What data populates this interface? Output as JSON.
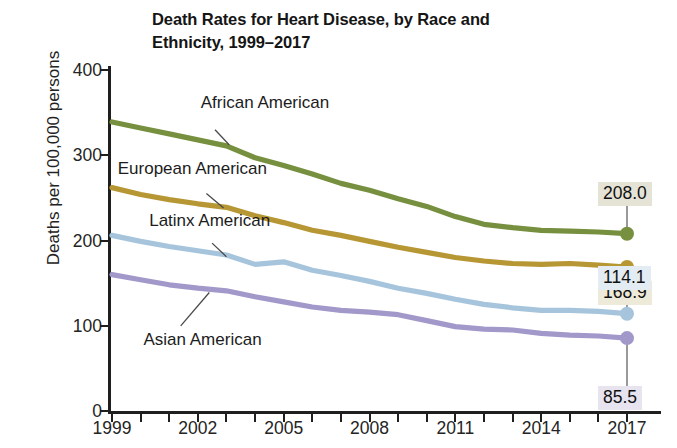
{
  "chart_data": {
    "type": "line",
    "title": "Death Rates for Heart Disease, by Race and Ethnicity, 1999–2017",
    "title_line1": "Death Rates for Heart Disease, by Race and",
    "title_line2": "Ethnicity, 1999–2017",
    "xlabel": "",
    "ylabel": "Deaths per 100,000 persons",
    "xlim": [
      1999,
      2017
    ],
    "ylim": [
      0,
      400
    ],
    "y_ticks": [
      0,
      100,
      200,
      300,
      400
    ],
    "x_ticks": [
      1999,
      2002,
      2005,
      2008,
      2011,
      2014,
      2017
    ],
    "x_tick_labels": [
      "1999",
      "2002",
      "2005",
      "2008",
      "2011",
      "2014",
      "2017"
    ],
    "y_tick_labels": [
      "0",
      "100",
      "200",
      "300",
      "400"
    ],
    "x": [
      1999,
      2000,
      2001,
      2002,
      2003,
      2004,
      2005,
      2006,
      2007,
      2008,
      2009,
      2010,
      2011,
      2012,
      2013,
      2014,
      2015,
      2016,
      2017
    ],
    "grid": false,
    "legend_position": "inline-labels",
    "series": [
      {
        "name": "African American",
        "color": "#77903f",
        "values": [
          339.0,
          332.0,
          325.0,
          318.0,
          311.0,
          297.0,
          288.0,
          278.0,
          267.0,
          259.0,
          249.0,
          240.0,
          228.0,
          219.0,
          215.0,
          212.0,
          211.0,
          210.0,
          208.0
        ],
        "end_value": "208.0",
        "label_x": 2002.1,
        "label_y": 360
      },
      {
        "name": "European American",
        "color": "#b79634",
        "values": [
          262.0,
          254.0,
          248.0,
          243.0,
          239.0,
          229.0,
          221.0,
          212.0,
          206.0,
          199.0,
          192.0,
          186.0,
          180.0,
          176.0,
          173.0,
          172.0,
          173.0,
          171.0,
          168.9
        ],
        "end_value": "168.9",
        "label_x": 1999.2,
        "label_y": 283
      },
      {
        "name": "Latinx American",
        "color": "#a6c5dd",
        "values": [
          206.0,
          199.0,
          193.0,
          188.0,
          183.0,
          172.0,
          175.0,
          165.0,
          159.0,
          152.0,
          144.0,
          138.0,
          131.0,
          125.0,
          121.0,
          118.0,
          118.0,
          117.0,
          114.1
        ],
        "end_value": "114.1",
        "label_x": 2000.3,
        "label_y": 222
      },
      {
        "name": "Asian American",
        "color": "#a298c9",
        "values": [
          160.0,
          154.0,
          148.0,
          144.0,
          141.0,
          134.0,
          128.0,
          122.0,
          118.0,
          116.0,
          113.0,
          106.0,
          99.0,
          96.0,
          95.0,
          91.0,
          89.0,
          88.0,
          85.5
        ],
        "end_value": "85.5",
        "label_x": 2000.1,
        "label_y": 82
      }
    ],
    "end_callouts": [
      {
        "value": "208.0",
        "color": "#77903f",
        "bg": "#e4e3d6"
      },
      {
        "value": "168.9",
        "color": "#b79634",
        "bg": "#eeead9"
      },
      {
        "value": "114.1",
        "color": "#a6c5dd",
        "bg": "#e3ecf3"
      },
      {
        "value": "85.5",
        "color": "#a298c9",
        "bg": "#e7e4ef"
      }
    ]
  }
}
